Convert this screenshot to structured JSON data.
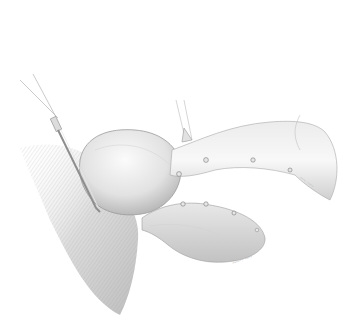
{
  "image": {
    "description": "Pencil medical illustration of uterus with fallopian tubes and ovary, a surgical instrument inserted at the left",
    "background": "#ffffff",
    "palette": {
      "shade_dark": "#8a8a8a",
      "shade_mid": "#bdbdbd",
      "shade_light": "#e4e4e4",
      "outline": "#9a9a9a"
    }
  },
  "signatures": {
    "upper": "~~ ~~",
    "lower": "~~~ ~~"
  }
}
